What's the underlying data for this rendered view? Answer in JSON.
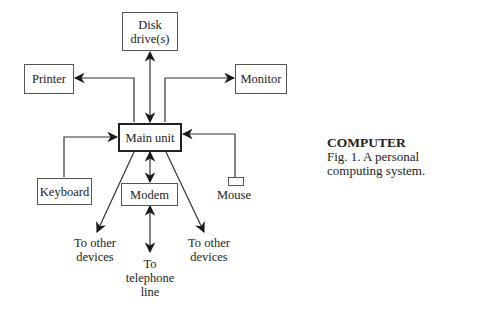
{
  "diagram": {
    "nodes": {
      "disk": "Disk drive(s)",
      "printer": "Printer",
      "monitor": "Monitor",
      "main": "Main unit",
      "keyboard": "Keyboard",
      "modem": "Modem",
      "mouse": "Mouse"
    },
    "endpoints": {
      "left_devices": "To other devices",
      "telephone": "To telephone line",
      "right_devices": "To other devices"
    },
    "edges": [
      {
        "from": "main",
        "to": "disk",
        "direction": "bidirectional"
      },
      {
        "from": "main",
        "to": "printer",
        "direction": "one-way"
      },
      {
        "from": "main",
        "to": "monitor",
        "direction": "one-way"
      },
      {
        "from": "keyboard",
        "to": "main",
        "direction": "one-way"
      },
      {
        "from": "mouse",
        "to": "main",
        "direction": "one-way"
      },
      {
        "from": "main",
        "to": "modem",
        "direction": "bidirectional"
      },
      {
        "from": "modem",
        "to": "telephone",
        "direction": "bidirectional"
      },
      {
        "from": "main",
        "to": "left_devices",
        "direction": "one-way"
      },
      {
        "from": "main",
        "to": "right_devices",
        "direction": "one-way"
      }
    ]
  },
  "caption": {
    "title": "COMPUTER",
    "text": "Fig. 1. A personal computing system."
  }
}
